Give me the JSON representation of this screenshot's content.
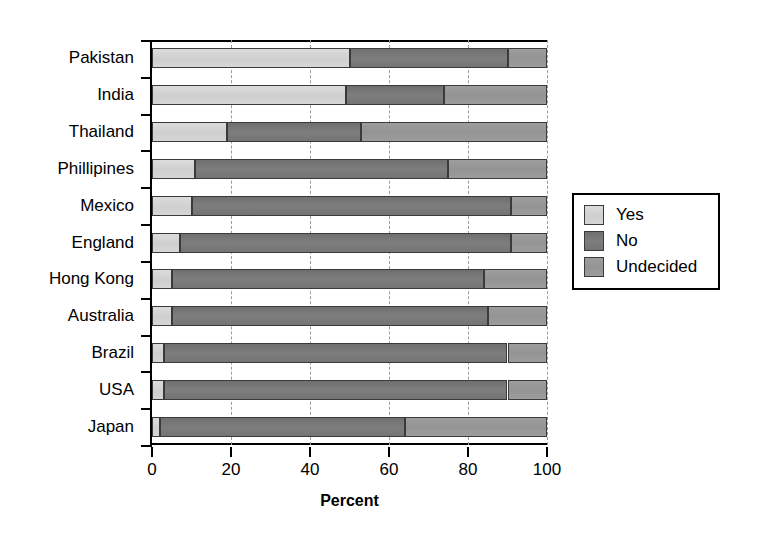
{
  "chart_data": {
    "type": "bar",
    "orientation": "horizontal",
    "stacked": true,
    "title": "",
    "xlabel": "Percent",
    "ylabel": "",
    "xlim": [
      0,
      100
    ],
    "xticks": [
      0,
      20,
      40,
      60,
      80,
      100
    ],
    "grid": "vertical-dashed",
    "legend_position": "right",
    "categories": [
      "Pakistan",
      "India",
      "Thailand",
      "Phillipines",
      "Mexico",
      "England",
      "Hong Kong",
      "Australia",
      "Brazil",
      "USA",
      "Japan"
    ],
    "series": [
      {
        "name": "Yes",
        "color": "#d2d2d2",
        "values": [
          50,
          49,
          19,
          11,
          10,
          7,
          5,
          5,
          3,
          3,
          2
        ]
      },
      {
        "name": "No",
        "color": "#787878",
        "values": [
          40,
          25,
          34,
          64,
          81,
          84,
          79,
          80,
          87,
          87,
          62
        ]
      },
      {
        "name": "Undecided",
        "color": "#9a9a9a",
        "values": [
          10,
          26,
          47,
          25,
          9,
          9,
          16,
          15,
          10,
          10,
          36
        ]
      }
    ]
  },
  "axis": {
    "x_title": "Percent",
    "tick_labels": [
      "0",
      "20",
      "40",
      "60",
      "80",
      "100"
    ]
  },
  "legend": {
    "entries": [
      {
        "label": "Yes",
        "color": "#d2d2d2"
      },
      {
        "label": "No",
        "color": "#787878"
      },
      {
        "label": "Undecided",
        "color": "#9a9a9a"
      }
    ]
  }
}
